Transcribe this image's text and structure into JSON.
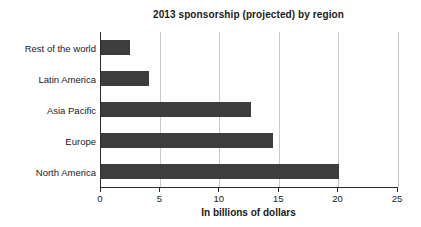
{
  "chart_data": {
    "type": "bar",
    "orientation": "horizontal",
    "title": "2013 sponsorship (projected) by region",
    "xlabel": "In billions of dollars",
    "categories": [
      "Rest of the world",
      "Latin America",
      "Asia Pacific",
      "Europe",
      "North America"
    ],
    "values": [
      2.4,
      4,
      12.6,
      14.5,
      20
    ],
    "xlim": [
      0,
      25
    ],
    "xticks": [
      0,
      5,
      10,
      15,
      20,
      25
    ],
    "grid": true,
    "legend": null,
    "colors": {
      "bar": "#3d3d3d",
      "gridline": "#c9c9c9",
      "axis": "#2b2b2b",
      "text": "#1a1a1a",
      "background": "#ffffff"
    }
  }
}
